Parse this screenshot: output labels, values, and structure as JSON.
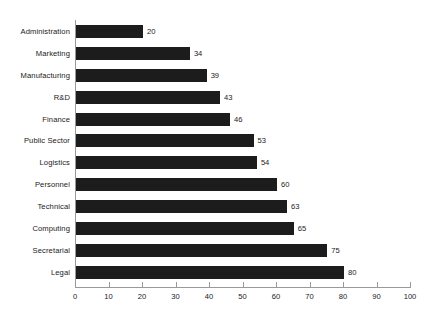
{
  "chart_data": {
    "type": "bar",
    "orientation": "horizontal",
    "title": "",
    "subtitle": "",
    "xlabel": "",
    "ylabel": "",
    "xlim": [
      0,
      100
    ],
    "xticks": [
      0,
      10,
      20,
      30,
      40,
      50,
      60,
      70,
      80,
      90,
      100
    ],
    "grid": false,
    "legend": null,
    "bar_color": "#1c1c1c",
    "axis_color": "#9a9a9a",
    "text_color": "#1a1a1a",
    "show_value_labels": true,
    "categories": [
      "Administration",
      "Marketing",
      "Manufacturing",
      "R&D",
      "Finance",
      "Public Sector",
      "Logistics",
      "Personnel",
      "Technical",
      "Computing",
      "Secretarial",
      "Legal"
    ],
    "values": [
      20,
      34,
      39,
      43,
      46,
      53,
      54,
      60,
      63,
      65,
      75,
      80
    ],
    "points": [
      {
        "category": "Administration",
        "value": 20,
        "label": "20"
      },
      {
        "category": "Marketing",
        "value": 34,
        "label": "34"
      },
      {
        "category": "Manufacturing",
        "value": 39,
        "label": "39"
      },
      {
        "category": "R&D",
        "value": 43,
        "label": "43"
      },
      {
        "category": "Finance",
        "value": 46,
        "label": "46"
      },
      {
        "category": "Public Sector",
        "value": 53,
        "label": "53"
      },
      {
        "category": "Logistics",
        "value": 54,
        "label": "54"
      },
      {
        "category": "Personnel",
        "value": 60,
        "label": "60"
      },
      {
        "category": "Technical",
        "value": 63,
        "label": "63"
      },
      {
        "category": "Computing",
        "value": 65,
        "label": "65"
      },
      {
        "category": "Secretarial",
        "value": 75,
        "label": "75"
      },
      {
        "category": "Legal",
        "value": 80,
        "label": "80"
      }
    ],
    "xtick_labels": [
      "0",
      "10",
      "20",
      "30",
      "40",
      "50",
      "60",
      "70",
      "80",
      "90",
      "100"
    ]
  }
}
